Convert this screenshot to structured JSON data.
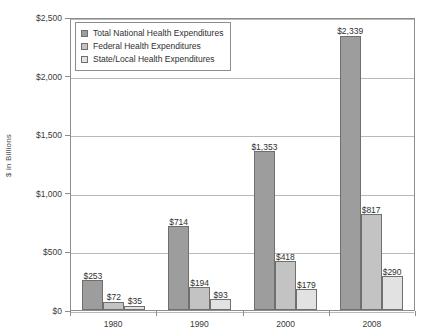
{
  "chart_data": {
    "type": "bar",
    "title": "",
    "xlabel": "",
    "ylabel": "$ in Billions",
    "ylim": [
      0,
      2500
    ],
    "ytick_values": [
      0,
      500,
      1000,
      1500,
      2000,
      2500
    ],
    "ytick_labels": [
      "$0",
      "$500",
      "$1,000",
      "$1,500",
      "$2,000",
      "$2,500"
    ],
    "grid": true,
    "legend_position": "top-left",
    "categories": [
      "1980",
      "1990",
      "2000",
      "2008"
    ],
    "series": [
      {
        "name": "Total National Health Expenditures",
        "color": "#9d9d9d",
        "values": [
          253,
          714,
          1353,
          2339
        ],
        "data_labels": [
          "$253",
          "$714",
          "$1,353",
          "$2,339"
        ]
      },
      {
        "name": "Federal Health Expenditures",
        "color": "#c3c3c3",
        "values": [
          72,
          194,
          418,
          817
        ],
        "data_labels": [
          "$72",
          "$194",
          "$418",
          "$817"
        ]
      },
      {
        "name": "State/Local Health Expenditures",
        "color": "#e2e2e2",
        "values": [
          35,
          93,
          179,
          290
        ],
        "data_labels": [
          "$35",
          "$93",
          "$179",
          "$290"
        ]
      }
    ]
  }
}
